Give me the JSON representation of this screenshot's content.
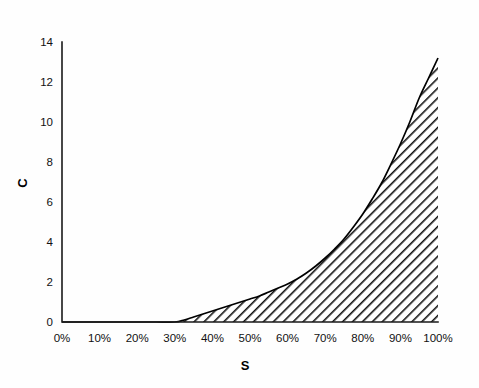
{
  "chart_data": {
    "type": "area",
    "title": "",
    "subtitle": "",
    "xlabel": "S",
    "ylabel": "C",
    "x_tick_labels": [
      "0%",
      "10%",
      "20%",
      "30%",
      "40%",
      "50%",
      "60%",
      "70%",
      "80%",
      "90%",
      "100%"
    ],
    "x_tick_values": [
      0,
      10,
      20,
      30,
      40,
      50,
      60,
      70,
      80,
      90,
      100
    ],
    "y_tick_labels": [
      "0",
      "2",
      "4",
      "6",
      "8",
      "10",
      "12",
      "14"
    ],
    "y_tick_values": [
      0,
      2,
      4,
      6,
      8,
      10,
      12,
      14
    ],
    "xlim": [
      0,
      100
    ],
    "ylim": [
      0,
      14
    ],
    "grid": false,
    "legend": null,
    "legend_position": "none",
    "fill_pattern": "diagonal-hatch",
    "fill_color": "#111111",
    "line_color": "#000000",
    "axis_color": "#1a1a1a",
    "background_color": "#ffffff",
    "closes_to_baseline_at_end": true,
    "series": [
      {
        "name": "C",
        "x": [
          0,
          5,
          10,
          15,
          20,
          25,
          30,
          32.5,
          35,
          37.5,
          40,
          42.5,
          45,
          47.5,
          50,
          52.5,
          55,
          57.5,
          60,
          62.5,
          65,
          67.5,
          70,
          72.5,
          75,
          77.5,
          80,
          82.5,
          85,
          87.5,
          90,
          92.5,
          95,
          97.5,
          100
        ],
        "values": [
          0,
          0,
          0,
          0,
          0,
          0,
          0,
          0.1,
          0.25,
          0.4,
          0.55,
          0.7,
          0.85,
          1.0,
          1.15,
          1.3,
          1.5,
          1.7,
          1.9,
          2.15,
          2.45,
          2.8,
          3.2,
          3.65,
          4.15,
          4.75,
          5.4,
          6.15,
          6.95,
          7.9,
          8.9,
          10.0,
          11.2,
          12.2,
          13.2
        ]
      }
    ],
    "annotations": []
  },
  "figure": {
    "plot_area": {
      "x_pixel_at_0": 62,
      "x_pixel_at_100": 438,
      "y_pixel_at_0": 322,
      "y_pixel_at_14": 42
    }
  }
}
